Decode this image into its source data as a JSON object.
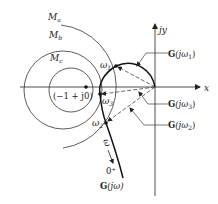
{
  "diagram": {
    "title": "",
    "axes": {
      "x_label": "x",
      "y_label": "jy"
    },
    "m_circles": [
      {
        "label": "M",
        "subscript": "a"
      },
      {
        "label": "M",
        "subscript": "b"
      },
      {
        "label": "M",
        "subscript": "c"
      }
    ],
    "critical_point": {
      "label": "(−1 + j0)"
    },
    "frequency_points": [
      {
        "label": "ω",
        "subscript": "1"
      },
      {
        "label": "ω",
        "subscript": "3"
      },
      {
        "label": "ω",
        "subscript": "2"
      }
    ],
    "vector_labels": [
      {
        "bold": "G",
        "rest": "(jω",
        "subscript": "1",
        "close": ")"
      },
      {
        "bold": "G",
        "rest": "(jω",
        "subscript": "3",
        "close": ")"
      },
      {
        "bold": "G",
        "rest": "(jω",
        "subscript": "2",
        "close": ")"
      }
    ],
    "direction": {
      "omega_label": "ω",
      "zero_label": "0⁺"
    },
    "curve_label": {
      "bold": "G",
      "rest": "(jω)"
    },
    "colors": {
      "line": "#222222",
      "dashed": "#444444",
      "background": "#ffffff"
    }
  }
}
